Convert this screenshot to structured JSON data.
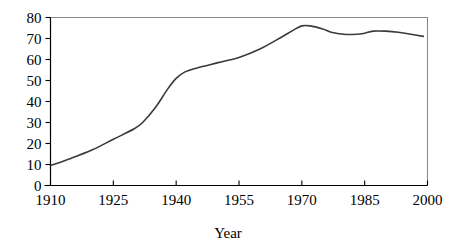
{
  "chart_data": {
    "type": "line",
    "title": "",
    "subtitle": "",
    "xlabel": "Year",
    "ylabel": "",
    "xlim": [
      1910,
      2000
    ],
    "ylim": [
      0,
      80
    ],
    "grid": false,
    "legend": false,
    "legend_position": "none",
    "x_ticks": [
      1910,
      1925,
      1940,
      1955,
      1970,
      1985,
      2000
    ],
    "x_tick_labels": [
      "1910",
      "1925",
      "1940",
      "1955",
      "1970",
      "1985",
      "2000"
    ],
    "y_ticks": [
      0,
      10,
      20,
      30,
      40,
      50,
      60,
      70,
      80
    ],
    "y_tick_labels": [
      "0",
      "10",
      "20",
      "30",
      "40",
      "50",
      "60",
      "70",
      "80"
    ],
    "series": [
      {
        "name": "value",
        "color": "#3a3a3a",
        "x": [
          1910,
          1915,
          1920,
          1925,
          1930,
          1932,
          1935,
          1938,
          1940,
          1942,
          1945,
          1950,
          1955,
          1960,
          1965,
          1968,
          1970,
          1972,
          1975,
          1977,
          1980,
          1983,
          1985,
          1987,
          1990,
          1993,
          1996,
          1999
        ],
        "values": [
          9.5,
          13,
          17,
          22,
          27,
          30,
          37,
          46,
          51,
          54,
          56,
          58.5,
          61,
          65,
          70.5,
          74,
          76,
          76,
          74.5,
          73,
          72,
          72,
          72.5,
          73.5,
          73.5,
          73,
          72,
          71
        ]
      }
    ],
    "annotations": []
  },
  "axis_titles": {
    "x": "Year"
  },
  "colors": {
    "line": "#3a3a3a",
    "axis": "#000000",
    "frame": "#8a8a8a",
    "background": "#ffffff"
  }
}
